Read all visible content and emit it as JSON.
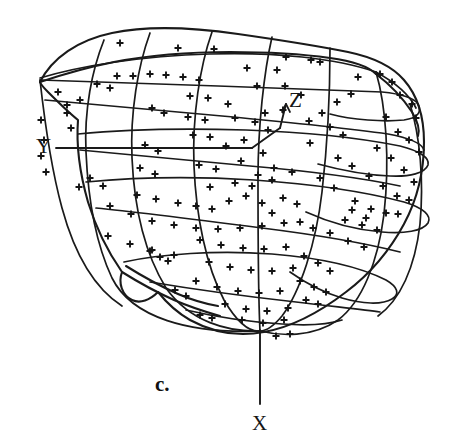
{
  "figure": {
    "caption": "c.",
    "caption_pos": [
      155,
      372
    ],
    "background_color": "#ffffff",
    "ink_color": "#1a1a1a"
  },
  "axes": [
    {
      "name": "x-axis",
      "label": "X",
      "label_pos": [
        252,
        411
      ],
      "line": [
        260,
        330,
        260,
        404
      ]
    },
    {
      "name": "y-axis",
      "label": "Y",
      "label_pos": [
        36,
        134
      ],
      "line": [
        56,
        148,
        252,
        148
      ]
    },
    {
      "name": "z-axis",
      "label": "Z",
      "label_pos": [
        289,
        88
      ],
      "line": [
        283,
        104,
        272,
        124
      ]
    }
  ],
  "axis_origin": [
    280,
    128
  ],
  "chart_data": {
    "type": "scatter",
    "title": "",
    "xlabel": "Y",
    "ylabel": "Z",
    "zlabel": "X",
    "grid": true,
    "legend": null,
    "marker": "plus",
    "marker_size": 7,
    "projection": "3d-sphere-wireframe",
    "point_count": 166,
    "points": [
      [
        117,
        76
      ],
      [
        133,
        76
      ],
      [
        150,
        74
      ],
      [
        166,
        75
      ],
      [
        183,
        77
      ],
      [
        199,
        80
      ],
      [
        97,
        84
      ],
      [
        110,
        88
      ],
      [
        58,
        92
      ],
      [
        67,
        105
      ],
      [
        67,
        113
      ],
      [
        41,
        120
      ],
      [
        44,
        140
      ],
      [
        41,
        156
      ],
      [
        46,
        172
      ],
      [
        80,
        100
      ],
      [
        71,
        128
      ],
      [
        79,
        187
      ],
      [
        120,
        43
      ],
      [
        178,
        48
      ],
      [
        214,
        49
      ],
      [
        247,
        68
      ],
      [
        277,
        70
      ],
      [
        286,
        57
      ],
      [
        311,
        60
      ],
      [
        320,
        62
      ],
      [
        257,
        86
      ],
      [
        285,
        86
      ],
      [
        301,
        95
      ],
      [
        265,
        113
      ],
      [
        283,
        110
      ],
      [
        310,
        143
      ],
      [
        263,
        153
      ],
      [
        241,
        161
      ],
      [
        274,
        168
      ],
      [
        292,
        172
      ],
      [
        337,
        102
      ],
      [
        351,
        94
      ],
      [
        358,
        77
      ],
      [
        380,
        74
      ],
      [
        392,
        82
      ],
      [
        400,
        95
      ],
      [
        412,
        104
      ],
      [
        416,
        118
      ],
      [
        386,
        117
      ],
      [
        398,
        132
      ],
      [
        409,
        140
      ],
      [
        419,
        152
      ],
      [
        377,
        148
      ],
      [
        391,
        158
      ],
      [
        404,
        170
      ],
      [
        414,
        182
      ],
      [
        369,
        176
      ],
      [
        383,
        186
      ],
      [
        397,
        196
      ],
      [
        409,
        200
      ],
      [
        355,
        201
      ],
      [
        371,
        209
      ],
      [
        386,
        213
      ],
      [
        398,
        214
      ],
      [
        345,
        220
      ],
      [
        362,
        225
      ],
      [
        377,
        230
      ],
      [
        330,
        233
      ],
      [
        348,
        241
      ],
      [
        364,
        247
      ],
      [
        110,
        206
      ],
      [
        131,
        214
      ],
      [
        152,
        221
      ],
      [
        174,
        225
      ],
      [
        196,
        228
      ],
      [
        218,
        229
      ],
      [
        240,
        228
      ],
      [
        262,
        226
      ],
      [
        284,
        223
      ],
      [
        108,
        236
      ],
      [
        130,
        244
      ],
      [
        152,
        250
      ],
      [
        174,
        255
      ],
      [
        229,
        201
      ],
      [
        246,
        196
      ],
      [
        262,
        203
      ],
      [
        272,
        213
      ],
      [
        200,
        240
      ],
      [
        221,
        245
      ],
      [
        243,
        248
      ],
      [
        264,
        249
      ],
      [
        286,
        247
      ],
      [
        209,
        262
      ],
      [
        230,
        267
      ],
      [
        251,
        270
      ],
      [
        272,
        271
      ],
      [
        293,
        268
      ],
      [
        196,
        281
      ],
      [
        217,
        287
      ],
      [
        238,
        291
      ],
      [
        259,
        293
      ],
      [
        280,
        291
      ],
      [
        225,
        304
      ],
      [
        246,
        309
      ],
      [
        267,
        311
      ],
      [
        288,
        308
      ],
      [
        242,
        320
      ],
      [
        263,
        323
      ],
      [
        284,
        320
      ],
      [
        304,
        256
      ],
      [
        318,
        263
      ],
      [
        330,
        271
      ],
      [
        300,
        281
      ],
      [
        314,
        287
      ],
      [
        326,
        292
      ],
      [
        306,
        300
      ],
      [
        318,
        304
      ],
      [
        150,
        251
      ],
      [
        160,
        257
      ],
      [
        168,
        261
      ],
      [
        137,
        195
      ],
      [
        156,
        199
      ],
      [
        178,
        203
      ],
      [
        90,
        178
      ],
      [
        103,
        186
      ],
      [
        235,
        183
      ],
      [
        252,
        186
      ],
      [
        210,
        187
      ],
      [
        196,
        206
      ],
      [
        212,
        209
      ],
      [
        199,
        165
      ],
      [
        216,
        169
      ],
      [
        226,
        146
      ],
      [
        244,
        140
      ],
      [
        193,
        135
      ],
      [
        210,
        137
      ],
      [
        188,
        117
      ],
      [
        205,
        120
      ],
      [
        190,
        96
      ],
      [
        208,
        98
      ],
      [
        228,
        104
      ],
      [
        235,
        118
      ],
      [
        320,
        178
      ],
      [
        334,
        188
      ],
      [
        338,
        158
      ],
      [
        352,
        166
      ],
      [
        330,
        127
      ],
      [
        343,
        135
      ],
      [
        352,
        210
      ],
      [
        366,
        218
      ],
      [
        300,
        222
      ],
      [
        313,
        228
      ],
      [
        152,
        108
      ],
      [
        164,
        113
      ],
      [
        145,
        145
      ],
      [
        158,
        151
      ],
      [
        140,
        168
      ],
      [
        155,
        174
      ],
      [
        268,
        130
      ],
      [
        255,
        122
      ],
      [
        309,
        121
      ],
      [
        322,
        113
      ],
      [
        297,
        204
      ],
      [
        283,
        198
      ],
      [
        258,
        175
      ],
      [
        272,
        180
      ],
      [
        175,
        290
      ],
      [
        186,
        296
      ],
      [
        200,
        315
      ],
      [
        212,
        318
      ],
      [
        276,
        336
      ],
      [
        290,
        334
      ]
    ]
  }
}
